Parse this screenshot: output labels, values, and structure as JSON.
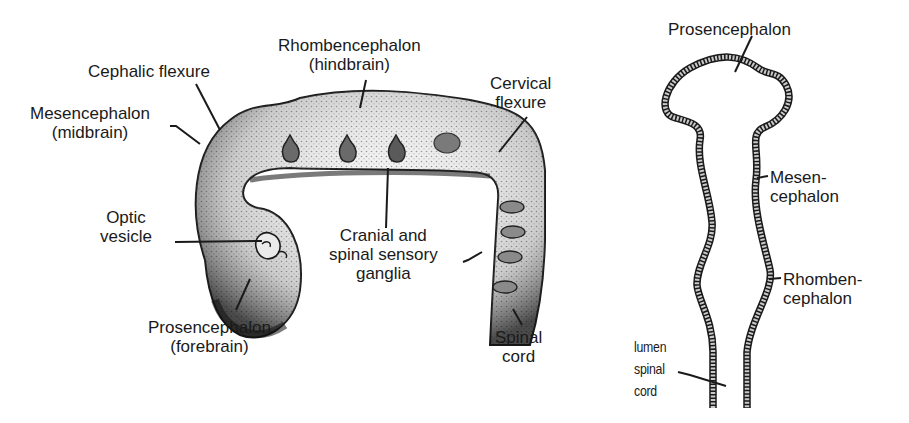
{
  "figure": {
    "left_panel": {
      "subject": "embryonic brain lateral view",
      "labels": {
        "cephalic_flexure": [
          "Cephalic flexure"
        ],
        "rhombencephalon": [
          "Rhombencephalon",
          "(hindbrain)"
        ],
        "cervical_flexure": [
          "Cervical",
          "flexure"
        ],
        "mesencephalon": [
          "Mesencephalon",
          "(midbrain)"
        ],
        "optic_vesicle": [
          "Optic",
          "vesicle"
        ],
        "cranial_spinal_ganglia": [
          "Cranial and",
          "spinal sensory",
          "ganglia"
        ],
        "prosencephalon": [
          "Prosencephalon",
          "(forebrain)"
        ],
        "spinal_cord": [
          "Spinal",
          "cord"
        ]
      }
    },
    "right_panel": {
      "subject": "neural tube frontal section",
      "labels": {
        "prosencephalon": [
          "Prosencephalon"
        ],
        "mesencephalon": [
          "Mesen-",
          "cephalon"
        ],
        "rhombencephalon": [
          "Rhomben-",
          "cephalon"
        ],
        "lumen_spinal_cord": [
          "lumen",
          "spinal",
          "cord"
        ]
      }
    },
    "colors": {
      "ink": "#1a1a1a",
      "stipple": "#3a3a3a",
      "background": "#ffffff"
    }
  }
}
